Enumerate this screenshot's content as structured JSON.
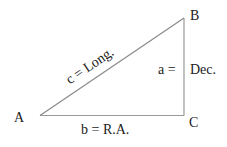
{
  "diagram": {
    "type": "right-triangle",
    "colors": {
      "line": "#9a9a9a",
      "text": "#222222",
      "background": "#ffffff"
    },
    "vertices": {
      "A": {
        "label": "A"
      },
      "B": {
        "label": "B"
      },
      "C": {
        "label": "C"
      }
    },
    "sides": {
      "a": {
        "label_left": "a =",
        "label_right": "Dec."
      },
      "b": {
        "label": "b = R.A."
      },
      "c": {
        "label": "c = Long."
      }
    }
  }
}
